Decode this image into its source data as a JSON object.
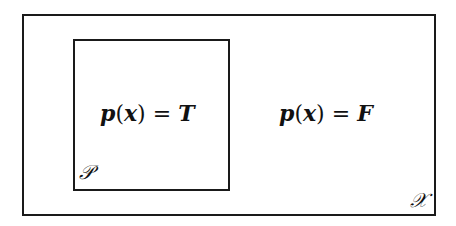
{
  "diagram": {
    "outer_set": {
      "label": "𝒳"
    },
    "inner_set": {
      "label": "𝒫"
    },
    "inside_expression": {
      "func": "p",
      "arg": "x",
      "value": "T"
    },
    "outside_expression": {
      "func": "p",
      "arg": "x",
      "value": "F"
    }
  }
}
